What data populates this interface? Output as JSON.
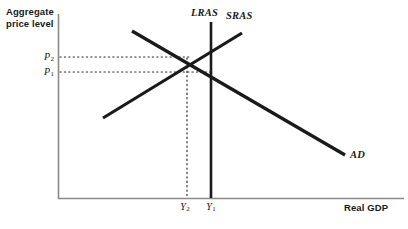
{
  "figure": {
    "type": "line-diagram",
    "domain": "economics-ad-as",
    "axes": {
      "y_title": "Aggregate\nprice level",
      "y_title_line1": "Aggregate",
      "y_title_line2": "price level",
      "x_title": "Real GDP",
      "axis_color": "#8a8a8a",
      "origin": {
        "x": 58,
        "y": 198
      },
      "x_end": {
        "x": 404,
        "y": 198
      },
      "y_top": {
        "x": 58,
        "y": 14
      }
    },
    "curve_color": "#1a1a1a",
    "guide_color": "#2b2b2b",
    "curves": [
      {
        "name": "LRAS",
        "label": "LRAS",
        "shape": "vertical",
        "x1": 211,
        "y1": 22,
        "x2": 211,
        "y2": 198,
        "label_x": 191,
        "label_y": 7
      },
      {
        "name": "SRAS",
        "label": "SRAS",
        "shape": "upward-sloping",
        "x1": 103,
        "y1": 118,
        "x2": 242,
        "y2": 33,
        "label_x": 226,
        "label_y": 10
      },
      {
        "name": "AD",
        "label": "AD",
        "shape": "downward-sloping",
        "x1": 132,
        "y1": 31,
        "x2": 345,
        "y2": 155,
        "label_x": 350,
        "label_y": 149
      }
    ],
    "tick_labels": [
      {
        "name": "P2",
        "base": "P",
        "sub": "2",
        "axis": "y",
        "x": 46,
        "y": 57
      },
      {
        "name": "P1",
        "base": "P",
        "sub": "1",
        "axis": "y",
        "x": 46,
        "y": 72
      },
      {
        "name": "Y2",
        "base": "Y",
        "sub": "2",
        "axis": "x",
        "x": 185,
        "y": 207
      },
      {
        "name": "Y1",
        "base": "Y",
        "sub": "1",
        "axis": "x",
        "x": 211,
        "y": 207
      }
    ],
    "guides": [
      {
        "name": "p2-guide",
        "orientation": "horizontal",
        "x1": 58,
        "y1": 57,
        "x2": 189,
        "y2": 57
      },
      {
        "name": "p1-guide",
        "orientation": "horizontal",
        "x1": 58,
        "y1": 72,
        "x2": 214,
        "y2": 72
      },
      {
        "name": "y2-guide",
        "orientation": "vertical",
        "x1": 187,
        "y1": 57,
        "x2": 187,
        "y2": 198
      }
    ],
    "equilibria": [
      {
        "name": "short-run-equilibrium",
        "x": 187,
        "y": 57,
        "price": "P2",
        "output": "Y2"
      },
      {
        "name": "long-run-equilibrium",
        "x": 211,
        "y": 72,
        "price": "P1",
        "output": "Y1"
      }
    ]
  }
}
